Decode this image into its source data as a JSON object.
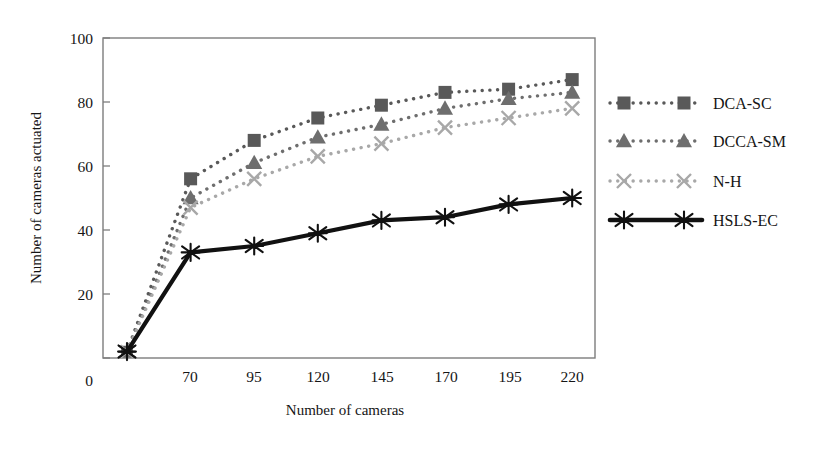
{
  "chart_data": {
    "type": "line",
    "title": "",
    "xlabel": "Number of cameras",
    "ylabel": "Number of cameras actuated",
    "categories": [
      "45",
      "70",
      "95",
      "120",
      "145",
      "170",
      "195",
      "220"
    ],
    "visible_xticks": [
      "70",
      "95",
      "120",
      "145",
      "170",
      "195",
      "220"
    ],
    "yticks": [
      0,
      20,
      40,
      60,
      80,
      100
    ],
    "ylim": [
      0,
      100
    ],
    "grid": false,
    "legend_position": "right",
    "series": [
      {
        "name": "DCA-SC",
        "marker": "square",
        "linestyle": "dotted",
        "color": "#595959",
        "values": [
          2,
          56,
          68,
          75,
          79,
          83,
          84,
          87
        ]
      },
      {
        "name": "DCCA-SM",
        "marker": "triangle",
        "linestyle": "dotted",
        "color": "#6e6e6e",
        "values": [
          2,
          50,
          61,
          69,
          73,
          78,
          81,
          83
        ]
      },
      {
        "name": "N-H",
        "marker": "x",
        "linestyle": "dotted",
        "color": "#a8a8a8",
        "values": [
          2,
          47,
          56,
          63,
          67,
          72,
          75,
          78
        ]
      },
      {
        "name": "HSLS-EC",
        "marker": "asterisk",
        "linestyle": "solid",
        "color": "#111111",
        "values": [
          2,
          33,
          35,
          39,
          43,
          44,
          48,
          50
        ]
      }
    ]
  },
  "axes": {
    "x_title": "Number of cameras",
    "y_title": "Number of cameras actuated",
    "x_tick_labels": [
      "70",
      "95",
      "120",
      "145",
      "170",
      "195",
      "220"
    ],
    "y_tick_labels": [
      "0",
      "20",
      "40",
      "60",
      "80",
      "100"
    ]
  },
  "legend": {
    "entries": [
      {
        "label": "DCA-SC",
        "icon": "square-marker-dotted-line-icon"
      },
      {
        "label": "DCCA-SM",
        "icon": "triangle-marker-dotted-line-icon"
      },
      {
        "label": "N-H",
        "icon": "x-marker-dotted-line-icon"
      },
      {
        "label": "HSLS-EC",
        "icon": "asterisk-marker-solid-line-icon"
      }
    ]
  },
  "colors": {
    "series_1": "#595959",
    "series_2": "#6e6e6e",
    "series_3": "#a8a8a8",
    "series_4": "#111111",
    "frame": "#777777",
    "background": "#ffffff"
  }
}
